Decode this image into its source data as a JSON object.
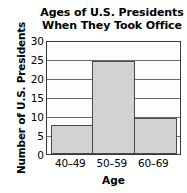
{
  "chart_data": {
    "type": "bar",
    "title": "Ages of U.S. Presidents When They Took Office",
    "title_lines": [
      "Ages of U.S. Presidents",
      "When They Took Office"
    ],
    "categories": [
      "40–49",
      "50–59",
      "60–69"
    ],
    "values": [
      8,
      25,
      10
    ],
    "xlabel": "Age",
    "ylabel": "Number of U.S. Presidents",
    "ylim": [
      0,
      30
    ],
    "ytick_labels": [
      "0",
      "5",
      "10",
      "15",
      "20",
      "25",
      "30"
    ],
    "ytick_values": [
      0,
      5,
      10,
      15,
      20,
      25,
      30
    ],
    "grid": "horizontal",
    "legend": "none",
    "histogram_adjacent_bars": true,
    "colors": {
      "bar_fill": "#d2d2d2",
      "bar_outline": "#4a4a4a",
      "gridline": "#6b6b6b",
      "axis": "#3a3a3a",
      "text": "#000000",
      "plot_background": "#fdfdfd",
      "page_background": "#ffffff"
    }
  }
}
